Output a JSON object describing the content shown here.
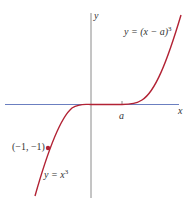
{
  "figure": {
    "axes": {
      "x_label": "x",
      "y_label": "y",
      "x_tick_label": "a",
      "axis_color": "#8a8a8a",
      "shifted_axis_segment_color": "#6b7fc0"
    },
    "curves": [
      {
        "name": "y = x^3",
        "label_prefix": "y = x",
        "label_exp": "3",
        "color": "#b22234"
      },
      {
        "name": "y = (x - a)^3",
        "label_prefix": "y = (x − a)",
        "label_exp": "3",
        "color": "#b22234"
      }
    ],
    "points": [
      {
        "label": "(−1, −1)",
        "x": -1,
        "y": -1,
        "color": "#b22234"
      }
    ]
  }
}
